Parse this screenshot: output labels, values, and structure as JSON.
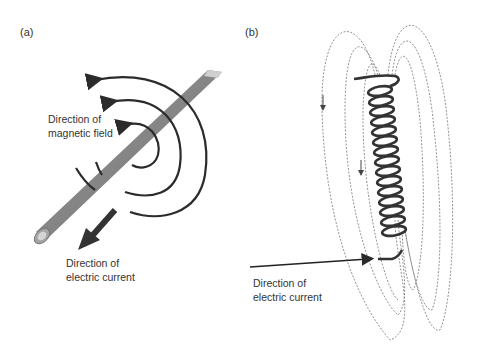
{
  "figure": {
    "panel_a": {
      "label": "(a)",
      "field_label_line1": "Direction of",
      "field_label_line2": "magnetic field",
      "current_label_line1": "Direction of",
      "current_label_line2": "electric current"
    },
    "panel_b": {
      "label": "(b)",
      "current_label_line1": "Direction of",
      "current_label_line2": "electric current"
    },
    "colors": {
      "rod": "#8a8a8a",
      "rod_dark": "#6e6e6e",
      "arrow": "#2b2b2b",
      "text": "#333333",
      "field_line": "#777777"
    }
  }
}
